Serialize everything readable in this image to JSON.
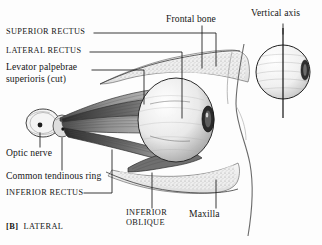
{
  "figure": {
    "panel_letter": "[B]",
    "panel_caption": "LATERAL",
    "background_color": "#fdfdfd",
    "ink_color": "#161616"
  },
  "labels": {
    "superior_rectus": "SUPERIOR RECTUS",
    "lateral_rectus": "LATERAL RECTUS",
    "levator_line1": "Levator palpebrae",
    "levator_line2": "superioris (cut)",
    "optic_nerve": "Optic nerve",
    "common_tendinous_ring": "Common tendinous ring",
    "inferior_rectus": "INFERIOR RECTUS",
    "inferior_oblique_line1": "INFERIOR",
    "inferior_oblique_line2": "OBLIQUE",
    "frontal_bone": "Frontal bone",
    "maxilla": "Maxilla",
    "vertical_axis": "Vertical axis"
  }
}
